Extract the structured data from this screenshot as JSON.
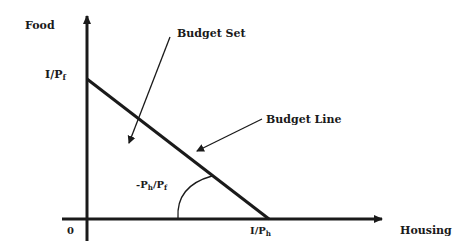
{
  "diagram": {
    "type": "budget-constraint",
    "colors": {
      "line": "#1a1a1a",
      "background": "#ffffff"
    },
    "axes": {
      "y_label": "Food",
      "x_label": "Housing",
      "origin_label": "0"
    },
    "intercepts": {
      "y": {
        "numerator": "I/P",
        "sub": "f"
      },
      "x": {
        "numerator": "I/P",
        "sub": "h"
      }
    },
    "slope": {
      "prefix": "-P",
      "sub1": "h",
      "mid": "/P",
      "sub2": "f"
    },
    "annotations": {
      "budget_set": "Budget Set",
      "budget_line": "Budget Line"
    }
  }
}
